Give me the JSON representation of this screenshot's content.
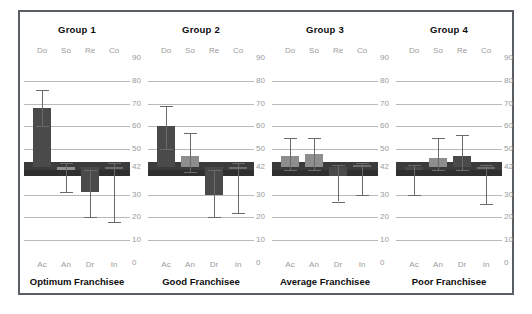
{
  "chart_data": {
    "type": "bar",
    "title": "",
    "xlabel": "",
    "ylabel": "",
    "ylim": [
      0,
      90
    ],
    "yticks": [
      0,
      10,
      20,
      30,
      42,
      50,
      60,
      70,
      80,
      90
    ],
    "ytick_labels": [
      "0",
      "10",
      "20",
      "30",
      "42",
      "50",
      "60",
      "70",
      "80",
      "90"
    ],
    "reference_value": 42,
    "grid": true,
    "legend": "none",
    "categories_top": [
      "Do",
      "So",
      "Re",
      "Co"
    ],
    "categories_bottom": [
      "Ac",
      "An",
      "Dr",
      "In"
    ],
    "panels": [
      {
        "title": "Group 1",
        "caption": "Optimum Franchisee",
        "series": [
          {
            "name": "Ac",
            "value": 68,
            "err_low": 60,
            "err_high": 76,
            "style": "dark"
          },
          {
            "name": "An",
            "value": 41,
            "err_low": 31,
            "err_high": 44,
            "style": "light"
          },
          {
            "name": "Dr",
            "value": 31,
            "err_low": 20,
            "err_high": 41,
            "style": "dark"
          },
          {
            "name": "In",
            "value": 42,
            "err_low": 18,
            "err_high": 44,
            "style": "hollow"
          }
        ]
      },
      {
        "title": "Group 2",
        "caption": "Good Franchisee",
        "series": [
          {
            "name": "Ac",
            "value": 60,
            "err_low": 50,
            "err_high": 69,
            "style": "dark"
          },
          {
            "name": "An",
            "value": 47,
            "err_low": 40,
            "err_high": 57,
            "style": "light"
          },
          {
            "name": "Dr",
            "value": 30,
            "err_low": 20,
            "err_high": 41,
            "style": "dark"
          },
          {
            "name": "In",
            "value": 42,
            "err_low": 22,
            "err_high": 44,
            "style": "hollow"
          }
        ]
      },
      {
        "title": "Group 3",
        "caption": "Average Franchisee",
        "series": [
          {
            "name": "Ac",
            "value": 47,
            "err_low": 41,
            "err_high": 55,
            "style": "light"
          },
          {
            "name": "An",
            "value": 48,
            "err_low": 41,
            "err_high": 55,
            "style": "light"
          },
          {
            "name": "Dr",
            "value": 38,
            "err_low": 27,
            "err_high": 43,
            "style": "dark"
          },
          {
            "name": "In",
            "value": 43,
            "err_low": 30,
            "err_high": 44,
            "style": "hollow"
          }
        ]
      },
      {
        "title": "Group 4",
        "caption": "Poor Franchisee",
        "series": [
          {
            "name": "Ac",
            "value": 41,
            "err_low": 30,
            "err_high": 43,
            "style": "dark"
          },
          {
            "name": "An",
            "value": 46,
            "err_low": 41,
            "err_high": 55,
            "style": "light"
          },
          {
            "name": "Dr",
            "value": 47,
            "err_low": 41,
            "err_high": 56,
            "style": "dark"
          },
          {
            "name": "In",
            "value": 42,
            "err_low": 26,
            "err_high": 43,
            "style": "hollow"
          }
        ]
      }
    ]
  },
  "colors": {
    "frame": "#5a5f66",
    "grid": "#b9b9b9",
    "bar_dark": "#4a4a4a",
    "bar_mid": "#6d6d6d",
    "bar_light": "#8e8e8e",
    "band": "#3b3b3b",
    "tick_text": "#9b9b9b",
    "title_text": "#0d0d0d",
    "background": "#ffffff"
  }
}
